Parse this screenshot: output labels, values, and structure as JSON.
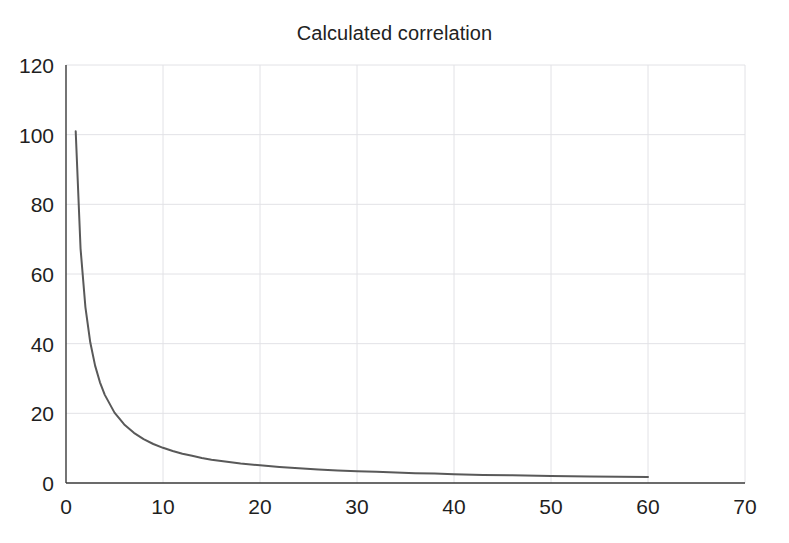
{
  "chart_data": {
    "type": "line",
    "title": "Calculated correlation",
    "xlabel": "",
    "ylabel": "",
    "xlim": [
      0,
      70
    ],
    "ylim": [
      0,
      120
    ],
    "xticks": [
      0,
      10,
      20,
      30,
      40,
      50,
      60,
      70
    ],
    "yticks": [
      0,
      20,
      40,
      60,
      80,
      100,
      120
    ],
    "grid": true,
    "legend": false,
    "legend_position": "none",
    "series": [
      {
        "name": "Calculated correlation",
        "color": "#595959",
        "line_width": 2,
        "x": [
          1,
          1.5,
          2,
          2.5,
          3,
          3.5,
          4,
          5,
          6,
          7,
          8,
          9,
          10,
          11,
          12,
          13,
          14,
          15,
          16,
          18,
          20,
          22,
          24,
          26,
          28,
          30,
          32,
          34,
          36,
          38,
          40,
          43,
          46,
          50,
          54,
          57,
          60
        ],
        "values": [
          101,
          67.3,
          50.5,
          40.4,
          33.7,
          28.9,
          25.3,
          20.2,
          16.8,
          14.4,
          12.6,
          11.2,
          10.1,
          9.2,
          8.4,
          7.8,
          7.2,
          6.7,
          6.3,
          5.6,
          5.1,
          4.6,
          4.2,
          3.9,
          3.6,
          3.4,
          3.2,
          3.0,
          2.8,
          2.7,
          2.5,
          2.3,
          2.2,
          2.0,
          1.9,
          1.8,
          1.7
        ],
        "function": "y = 101 / x"
      }
    ]
  },
  "axes": {
    "axis_color": "#3a3a3a",
    "grid_color": "#e2e2e6",
    "background": "#ffffff"
  },
  "labels": {
    "y": [
      "0",
      "20",
      "40",
      "60",
      "80",
      "100",
      "120"
    ],
    "x": [
      "0",
      "10",
      "20",
      "30",
      "40",
      "50",
      "60",
      "70"
    ]
  }
}
